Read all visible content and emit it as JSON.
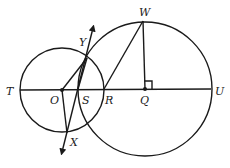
{
  "diagram": {
    "type": "geometry",
    "labels": {
      "T": "T",
      "O": "O",
      "S": "S",
      "R": "R",
      "Q": "Q",
      "U": "U",
      "W": "W",
      "Y": "Y",
      "X": "X"
    },
    "points": {
      "O": [
        62,
        90
      ],
      "Q": [
        145,
        89
      ],
      "T": [
        20,
        90
      ],
      "U": [
        211,
        89
      ],
      "R": [
        104,
        89
      ],
      "S": [
        78,
        89
      ],
      "W": [
        143,
        21
      ],
      "Y": [
        87,
        58
      ],
      "X": [
        67,
        133
      ]
    },
    "circles": [
      {
        "name": "circle-O",
        "center": "O",
        "radius": 42
      },
      {
        "name": "circle-Q",
        "center": "Q",
        "radius": 67
      }
    ],
    "marks": {
      "right_angle_at": "Q"
    },
    "colors": {
      "stroke": "#1a1a1a",
      "background": "#ffffff"
    }
  }
}
